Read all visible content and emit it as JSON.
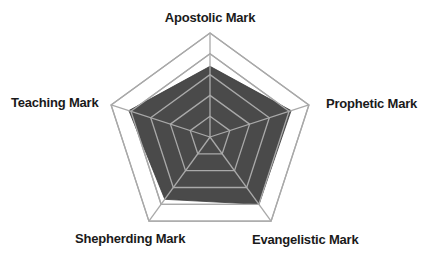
{
  "chart_data": {
    "type": "radar",
    "title": "",
    "categories": [
      "Apostolic Mark",
      "Prophetic Mark",
      "Evangelistic Mark",
      "Shepherding Mark",
      "Teaching Mark"
    ],
    "series": [
      {
        "name": "Profile",
        "values": [
          3.4,
          4.1,
          4.0,
          3.7,
          4.1
        ]
      }
    ],
    "rlim": [
      0,
      5
    ],
    "rings": 5,
    "grid": true,
    "legend": "none",
    "colors": {
      "fill": "#4a4a4a",
      "grid": "#a9a9a9",
      "label": "#1a1a1a"
    }
  },
  "labels": {
    "apostolic": "Apostolic Mark",
    "prophetic": "Prophetic Mark",
    "evangelistic": "Evangelistic Mark",
    "shepherding": "Shepherding Mark",
    "teaching": "Teaching Mark"
  }
}
